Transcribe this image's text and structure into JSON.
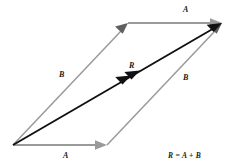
{
  "figure": {
    "background_color": "#ffffff",
    "component_vector_color": "#9a9a9a",
    "resultant_vector_color": "#111111",
    "labels": {
      "a_top": "A",
      "a_bottom": "A",
      "b_left": "B",
      "b_right": "B",
      "resultant": "R",
      "equation": "R = A + B"
    },
    "geometry": {
      "origin": [
        13,
        145
      ],
      "a_tip_bottom": [
        107,
        145
      ],
      "b_tip_left": [
        128,
        23
      ],
      "resultant_tip": [
        222,
        23
      ],
      "a_tip_top": [
        222,
        23
      ],
      "b_tip_right": [
        222,
        23
      ]
    },
    "vectors": [
      {
        "name": "A",
        "role": "component",
        "from": [
          13,
          145
        ],
        "to": [
          107,
          145
        ],
        "color": "#9a9a9a",
        "arrowheads": 1
      },
      {
        "name": "B",
        "role": "component",
        "from": [
          13,
          145
        ],
        "to": [
          128,
          23
        ],
        "color": "#9a9a9a",
        "arrowheads": 1
      },
      {
        "name": "A",
        "role": "component-translated",
        "from": [
          128,
          23
        ],
        "to": [
          222,
          23
        ],
        "color": "#9a9a9a",
        "arrowheads": 1
      },
      {
        "name": "B",
        "role": "component-translated",
        "from": [
          107,
          145
        ],
        "to": [
          222,
          23
        ],
        "color": "#9a9a9a",
        "arrowheads": 1
      },
      {
        "name": "R",
        "role": "resultant",
        "from": [
          13,
          145
        ],
        "to": [
          222,
          23
        ],
        "color": "#111111",
        "arrowheads": 2
      }
    ]
  }
}
